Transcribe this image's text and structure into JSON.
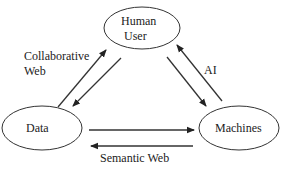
{
  "nodes": {
    "human_user": {
      "line1": "Human",
      "line2": "User"
    },
    "data": {
      "label": "Data"
    },
    "machines": {
      "label": "Machines"
    }
  },
  "edges": {
    "collaborative_web": {
      "line1": "Collaborative",
      "line2": "Web",
      "between": [
        "Data",
        "Human User"
      ]
    },
    "ai": {
      "label": "AI",
      "between": [
        "Human User",
        "Machines"
      ]
    },
    "semantic_web": {
      "label": "Semantic Web",
      "between": [
        "Data",
        "Machines"
      ]
    }
  },
  "colors": {
    "stroke": "#333333",
    "text": "#222222",
    "background": "#ffffff"
  }
}
